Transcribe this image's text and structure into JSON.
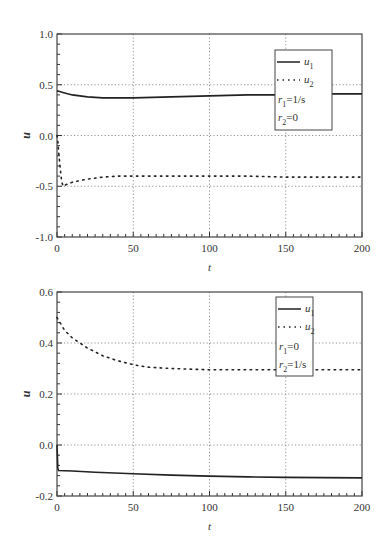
{
  "chart_data": [
    {
      "type": "line",
      "title": "",
      "xlabel": "t",
      "ylabel": "u",
      "xlim": [
        0,
        200
      ],
      "ylim": [
        -1.0,
        1.0
      ],
      "xticks": [
        "0",
        "50",
        "100",
        "150",
        "200"
      ],
      "yticks": [
        "-1.0",
        "-0.5",
        "0.0",
        "0.5",
        "1.0"
      ],
      "grid": true,
      "legend_position": "upper right",
      "legend": {
        "entries": [
          {
            "label": "u1",
            "main": "u",
            "sub": "1",
            "style": "solid"
          },
          {
            "label": "u2",
            "main": "u",
            "sub": "2",
            "style": "dotted"
          }
        ],
        "annotations": [
          {
            "main": "r",
            "sub": "1",
            "rest": "=1/s"
          },
          {
            "main": "r",
            "sub": "2",
            "rest": "=0"
          }
        ]
      },
      "series": [
        {
          "name": "u1",
          "style": "solid",
          "x": [
            0,
            5,
            10,
            20,
            30,
            40,
            50,
            75,
            100,
            125,
            150,
            175,
            200
          ],
          "values": [
            0.44,
            0.42,
            0.4,
            0.38,
            0.37,
            0.37,
            0.37,
            0.38,
            0.39,
            0.4,
            0.4,
            0.41,
            0.41
          ]
        },
        {
          "name": "u2",
          "style": "dotted",
          "x": [
            0,
            0.5,
            1,
            2,
            3,
            4,
            5,
            10,
            20,
            30,
            40,
            50,
            75,
            100,
            125,
            150,
            175,
            200
          ],
          "values": [
            0.0,
            -0.05,
            -0.15,
            -0.3,
            -0.45,
            -0.5,
            -0.49,
            -0.46,
            -0.43,
            -0.41,
            -0.4,
            -0.4,
            -0.4,
            -0.4,
            -0.4,
            -0.41,
            -0.41,
            -0.41
          ]
        }
      ]
    },
    {
      "type": "line",
      "title": "",
      "xlabel": "t",
      "ylabel": "u",
      "xlim": [
        0,
        200
      ],
      "ylim": [
        -0.2,
        0.6
      ],
      "xticks": [
        "0",
        "50",
        "100",
        "150",
        "200"
      ],
      "yticks": [
        "-0.2",
        "0.0",
        "0.2",
        "0.4",
        "0.6"
      ],
      "grid": true,
      "legend_position": "upper right",
      "legend": {
        "entries": [
          {
            "label": "u1",
            "main": "u",
            "sub": "1",
            "style": "solid"
          },
          {
            "label": "u2",
            "main": "u",
            "sub": "2",
            "style": "dotted"
          }
        ],
        "annotations": [
          {
            "main": "r",
            "sub": "1",
            "rest": "=0"
          },
          {
            "main": "r",
            "sub": "2",
            "rest": "=1/s"
          }
        ]
      },
      "series": [
        {
          "name": "u1",
          "style": "solid",
          "x": [
            0,
            0.5,
            1,
            10,
            25,
            50,
            75,
            100,
            125,
            150,
            175,
            200
          ],
          "values": [
            0.0,
            -0.09,
            -0.1,
            -0.102,
            -0.107,
            -0.113,
            -0.118,
            -0.122,
            -0.125,
            -0.127,
            -0.128,
            -0.129
          ]
        },
        {
          "name": "u2",
          "style": "dotted",
          "x": [
            0,
            2,
            5,
            10,
            15,
            20,
            25,
            30,
            40,
            50,
            60,
            75,
            100,
            125,
            150,
            175,
            200
          ],
          "values": [
            0.5,
            0.48,
            0.45,
            0.42,
            0.4,
            0.38,
            0.365,
            0.35,
            0.33,
            0.315,
            0.305,
            0.3,
            0.295,
            0.295,
            0.295,
            0.295,
            0.295
          ]
        }
      ]
    }
  ]
}
